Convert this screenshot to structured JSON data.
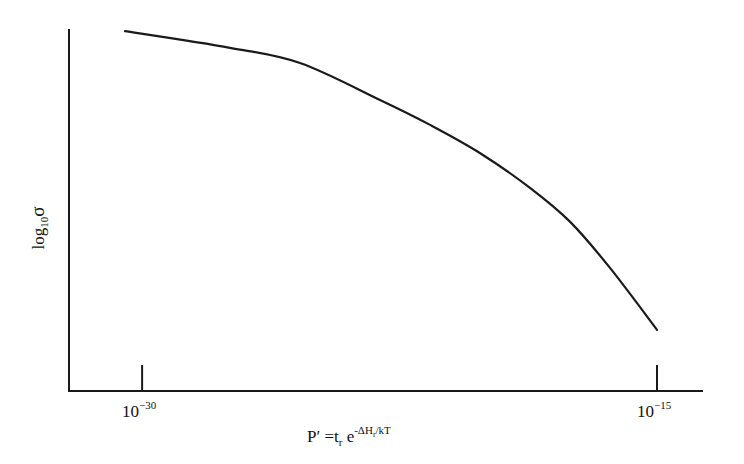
{
  "chart_data": {
    "type": "line",
    "title": "",
    "xlabel": {
      "base": "P′ =t",
      "base_sub": "r",
      "exp_base": " e",
      "exp": "-ΔH",
      "exp_sub": "r",
      "exp_tail": "/kT",
      "full_text": "P′ = t_r e^(-ΔH_r/kT)"
    },
    "ylabel": {
      "base": "log",
      "sub": "10",
      "symbol": "σ",
      "full_text": "log10 σ"
    },
    "x_scale": "log10",
    "xlim": [
      -32.13,
      -13.66
    ],
    "ylim": [
      0,
      1
    ],
    "y_units": "normalized (qualitative, no tick values shown)",
    "grid": false,
    "legend": "none",
    "x_ticks": [
      {
        "value": -30,
        "base": "10",
        "exp": "−30"
      },
      {
        "value": -15,
        "base": "10",
        "exp": "−15"
      }
    ],
    "series": [
      {
        "name": "log10 sigma vs P'",
        "x": [
          -30.5,
          -27.44,
          -25.4,
          -23.07,
          -21.61,
          -20.15,
          -18.7,
          -17.53,
          -16.37,
          -15.0
        ],
        "y": [
          0.994,
          0.948,
          0.906,
          0.804,
          0.735,
          0.657,
          0.561,
          0.467,
          0.34,
          0.169
        ]
      }
    ]
  }
}
